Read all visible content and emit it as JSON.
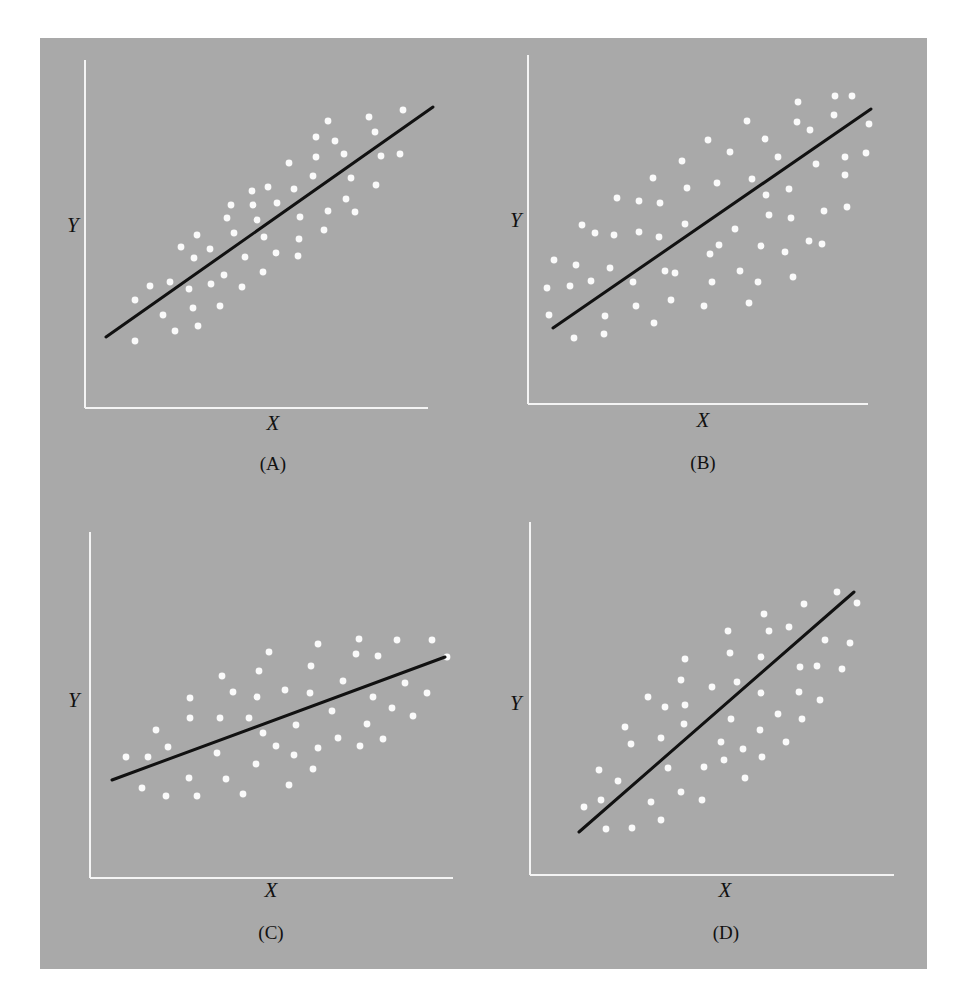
{
  "figure": {
    "background": "#a9a9a9",
    "point_color": "#fafafa",
    "line_color": "#111111",
    "axis_color": "#f4f4f4"
  },
  "chart_data": [
    {
      "type": "scatter",
      "id": "A",
      "caption": "(A)",
      "xlabel": "X",
      "ylabel": "Y",
      "grid": false,
      "legend": null,
      "description": "Strong positive linear relationship; points tightly clustered around regression line",
      "axes": {
        "y_axis": [
          85,
          60,
          85,
          408
        ],
        "x_axis": [
          85,
          408,
          428,
          408
        ]
      },
      "label_pos": {
        "y": [
          67,
          232
        ],
        "x": [
          273,
          430
        ],
        "caption": [
          273,
          470
        ]
      },
      "regression_line": [
        [
          106,
          337
        ],
        [
          433,
          107
        ]
      ],
      "points": [
        [
          135,
          300
        ],
        [
          150,
          286
        ],
        [
          163,
          315
        ],
        [
          170,
          282
        ],
        [
          175,
          331
        ],
        [
          135,
          341
        ],
        [
          181,
          247
        ],
        [
          189,
          289
        ],
        [
          193,
          308
        ],
        [
          194,
          258
        ],
        [
          197,
          235
        ],
        [
          198,
          326
        ],
        [
          210,
          249
        ],
        [
          211,
          284
        ],
        [
          220,
          306
        ],
        [
          224,
          275
        ],
        [
          227,
          218
        ],
        [
          231,
          205
        ],
        [
          234,
          233
        ],
        [
          242,
          287
        ],
        [
          245,
          257
        ],
        [
          252,
          191
        ],
        [
          253,
          205
        ],
        [
          257,
          220
        ],
        [
          263,
          272
        ],
        [
          264,
          237
        ],
        [
          268,
          187
        ],
        [
          276,
          253
        ],
        [
          277,
          203
        ],
        [
          289,
          163
        ],
        [
          294,
          189
        ],
        [
          298,
          256
        ],
        [
          299,
          239
        ],
        [
          300,
          217
        ],
        [
          313,
          176
        ],
        [
          316,
          157
        ],
        [
          316,
          137
        ],
        [
          324,
          230
        ],
        [
          328,
          211
        ],
        [
          328,
          121
        ],
        [
          335,
          141
        ],
        [
          344,
          154
        ],
        [
          346,
          199
        ],
        [
          351,
          178
        ],
        [
          355,
          212
        ],
        [
          369,
          117
        ],
        [
          375,
          132
        ],
        [
          376,
          185
        ],
        [
          381,
          156
        ],
        [
          400,
          154
        ],
        [
          403,
          110
        ]
      ]
    },
    {
      "type": "scatter",
      "id": "B",
      "caption": "(B)",
      "xlabel": "X",
      "ylabel": "Y",
      "grid": false,
      "legend": null,
      "description": "Positive linear relationship with wide scatter around regression line",
      "axes": {
        "y_axis": [
          528,
          55,
          528,
          404
        ],
        "x_axis": [
          528,
          404,
          868,
          404
        ]
      },
      "label_pos": {
        "y": [
          510,
          227
        ],
        "x": [
          703,
          427
        ],
        "caption": [
          703,
          469
        ]
      },
      "regression_line": [
        [
          553,
          328
        ],
        [
          871,
          109
        ]
      ],
      "points": [
        [
          554,
          260
        ],
        [
          547,
          288
        ],
        [
          549,
          315
        ],
        [
          570,
          286
        ],
        [
          576,
          265
        ],
        [
          574,
          338
        ],
        [
          582,
          225
        ],
        [
          591,
          281
        ],
        [
          595,
          233
        ],
        [
          605,
          316
        ],
        [
          604,
          334
        ],
        [
          610,
          268
        ],
        [
          614,
          235
        ],
        [
          617,
          198
        ],
        [
          633,
          282
        ],
        [
          636,
          306
        ],
        [
          639,
          201
        ],
        [
          639,
          232
        ],
        [
          653,
          178
        ],
        [
          654,
          323
        ],
        [
          659,
          237
        ],
        [
          660,
          203
        ],
        [
          665,
          271
        ],
        [
          671,
          300
        ],
        [
          675,
          273
        ],
        [
          682,
          161
        ],
        [
          685,
          224
        ],
        [
          687,
          188
        ],
        [
          704,
          306
        ],
        [
          708,
          140
        ],
        [
          710,
          254
        ],
        [
          712,
          282
        ],
        [
          717,
          183
        ],
        [
          719,
          245
        ],
        [
          730,
          152
        ],
        [
          735,
          229
        ],
        [
          740,
          271
        ],
        [
          747,
          121
        ],
        [
          749,
          303
        ],
        [
          752,
          179
        ],
        [
          758,
          282
        ],
        [
          761,
          246
        ],
        [
          765,
          139
        ],
        [
          766,
          195
        ],
        [
          769,
          215
        ],
        [
          778,
          157
        ],
        [
          785,
          252
        ],
        [
          789,
          189
        ],
        [
          791,
          218
        ],
        [
          793,
          277
        ],
        [
          797,
          122
        ],
        [
          798,
          102
        ],
        [
          809,
          241
        ],
        [
          810,
          130
        ],
        [
          816,
          164
        ],
        [
          822,
          244
        ],
        [
          824,
          211
        ],
        [
          834,
          115
        ],
        [
          835,
          96
        ],
        [
          845,
          157
        ],
        [
          845,
          175
        ],
        [
          847,
          207
        ],
        [
          852,
          96
        ],
        [
          866,
          153
        ],
        [
          869,
          124
        ]
      ]
    },
    {
      "type": "scatter",
      "id": "C",
      "caption": "(C)",
      "xlabel": "X",
      "ylabel": "Y",
      "grid": false,
      "legend": null,
      "description": "Weak positive relationship; shallow regression slope with wide scatter",
      "axes": {
        "y_axis": [
          90,
          532,
          90,
          878
        ],
        "x_axis": [
          90,
          878,
          453,
          878
        ]
      },
      "label_pos": {
        "y": [
          68,
          707
        ],
        "x": [
          271,
          897
        ],
        "caption": [
          271,
          939
        ]
      },
      "regression_line": [
        [
          112,
          780
        ],
        [
          445,
          657
        ]
      ],
      "points": [
        [
          126,
          757
        ],
        [
          142,
          788
        ],
        [
          148,
          757
        ],
        [
          156,
          730
        ],
        [
          166,
          796
        ],
        [
          168,
          747
        ],
        [
          189,
          778
        ],
        [
          190,
          718
        ],
        [
          190,
          698
        ],
        [
          197,
          796
        ],
        [
          217,
          753
        ],
        [
          220,
          718
        ],
        [
          222,
          676
        ],
        [
          226,
          779
        ],
        [
          233,
          692
        ],
        [
          243,
          794
        ],
        [
          249,
          718
        ],
        [
          256,
          764
        ],
        [
          257,
          697
        ],
        [
          259,
          671
        ],
        [
          263,
          733
        ],
        [
          269,
          652
        ],
        [
          276,
          746
        ],
        [
          285,
          690
        ],
        [
          289,
          785
        ],
        [
          294,
          755
        ],
        [
          296,
          725
        ],
        [
          310,
          693
        ],
        [
          311,
          666
        ],
        [
          313,
          769
        ],
        [
          318,
          748
        ],
        [
          318,
          644
        ],
        [
          332,
          711
        ],
        [
          338,
          738
        ],
        [
          343,
          681
        ],
        [
          356,
          654
        ],
        [
          359,
          639
        ],
        [
          360,
          746
        ],
        [
          367,
          724
        ],
        [
          373,
          697
        ],
        [
          378,
          656
        ],
        [
          383,
          739
        ],
        [
          392,
          708
        ],
        [
          397,
          640
        ],
        [
          405,
          683
        ],
        [
          413,
          716
        ],
        [
          427,
          693
        ],
        [
          432,
          640
        ],
        [
          447,
          657
        ]
      ]
    },
    {
      "type": "scatter",
      "id": "D",
      "caption": "(D)",
      "xlabel": "X",
      "ylabel": "Y",
      "grid": false,
      "legend": null,
      "description": "Positive relationship with steep regression slope and moderate scatter",
      "axes": {
        "y_axis": [
          530,
          522,
          530,
          875
        ],
        "x_axis": [
          530,
          875,
          894,
          875
        ]
      },
      "label_pos": {
        "y": [
          510,
          710
        ],
        "x": [
          725,
          897
        ],
        "caption": [
          726,
          939
        ]
      },
      "regression_line": [
        [
          579,
          832
        ],
        [
          854,
          592
        ]
      ],
      "points": [
        [
          584,
          807
        ],
        [
          599,
          770
        ],
        [
          601,
          800
        ],
        [
          606,
          829
        ],
        [
          618,
          781
        ],
        [
          625,
          727
        ],
        [
          631,
          744
        ],
        [
          632,
          828
        ],
        [
          648,
          697
        ],
        [
          651,
          802
        ],
        [
          661,
          738
        ],
        [
          661,
          820
        ],
        [
          665,
          707
        ],
        [
          668,
          768
        ],
        [
          681,
          792
        ],
        [
          681,
          680
        ],
        [
          684,
          724
        ],
        [
          685,
          659
        ],
        [
          685,
          705
        ],
        [
          702,
          800
        ],
        [
          704,
          767
        ],
        [
          712,
          687
        ],
        [
          721,
          742
        ],
        [
          724,
          760
        ],
        [
          728,
          631
        ],
        [
          730,
          653
        ],
        [
          731,
          719
        ],
        [
          737,
          682
        ],
        [
          743,
          749
        ],
        [
          745,
          778
        ],
        [
          760,
          730
        ],
        [
          761,
          657
        ],
        [
          761,
          693
        ],
        [
          762,
          757
        ],
        [
          764,
          614
        ],
        [
          769,
          631
        ],
        [
          778,
          714
        ],
        [
          786,
          742
        ],
        [
          789,
          627
        ],
        [
          799,
          692
        ],
        [
          800,
          667
        ],
        [
          802,
          719
        ],
        [
          804,
          604
        ],
        [
          817,
          666
        ],
        [
          820,
          700
        ],
        [
          825,
          640
        ],
        [
          837,
          592
        ],
        [
          842,
          669
        ],
        [
          850,
          643
        ],
        [
          857,
          603
        ]
      ]
    }
  ]
}
